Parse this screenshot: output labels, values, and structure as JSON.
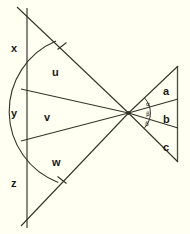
{
  "figure": {
    "background_color": "#fffff2",
    "stroke_color": "#33332b",
    "label_color": "#1a1a14"
  },
  "left_segments": [
    {
      "id": "x",
      "label": "x",
      "x": 11,
      "y": 43
    },
    {
      "id": "y",
      "label": "y",
      "x": 11,
      "y": 108
    },
    {
      "id": "z",
      "label": "z",
      "x": 11,
      "y": 178
    }
  ],
  "left_angles": [
    {
      "id": "u",
      "label": "u",
      "x": 52,
      "y": 67
    },
    {
      "id": "v",
      "label": "v",
      "x": 44,
      "y": 112
    },
    {
      "id": "w",
      "label": "w",
      "x": 52,
      "y": 157
    }
  ],
  "right_sides": [
    {
      "id": "a",
      "label": "a",
      "x": 163,
      "y": 86
    },
    {
      "id": "b",
      "label": "b",
      "x": 163,
      "y": 114
    },
    {
      "id": "c",
      "label": "c",
      "x": 163,
      "y": 142
    }
  ],
  "right_angles": [
    {
      "id": "alpha",
      "label": "α",
      "x": 146,
      "y": 101
    },
    {
      "id": "beta",
      "label": "β",
      "x": 146,
      "y": 111
    },
    {
      "id": "delta",
      "label": "δ",
      "x": 145,
      "y": 121
    }
  ],
  "geometry": {
    "vertex": {
      "x": 128.5,
      "y": 113
    },
    "left_axis": {
      "x": 27,
      "y_top": 8,
      "y_bottom": 228
    },
    "right_axis": {
      "x": 177,
      "y_top": 66,
      "y_bottom": 162
    },
    "rays": [
      {
        "id": "ray-top",
        "to_x": 17,
        "to_y": 7
      },
      {
        "id": "ray-upper-mid",
        "to_x": 21,
        "to_y": 89
      },
      {
        "id": "ray-lower-mid",
        "to_x": 21,
        "to_y": 141
      },
      {
        "id": "ray-bottom",
        "to_x": 21,
        "to_y": 226
      }
    ],
    "right_rays": [
      {
        "id": "right-ray-top",
        "to_x": 178,
        "to_y": 66
      },
      {
        "id": "right-ray-upper-mid",
        "to_x": 178,
        "to_y": 99
      },
      {
        "id": "right-ray-lower-mid",
        "to_x": 178,
        "to_y": 128
      },
      {
        "id": "right-ray-bottom",
        "to_x": 178,
        "to_y": 162
      }
    ],
    "left_arc_radius": 76,
    "right_arc_radius": 22,
    "tick_marks": [
      {
        "id": "tick-upper",
        "x": 62,
        "y": 46
      },
      {
        "id": "tick-lower",
        "x": 62,
        "y": 180
      }
    ]
  }
}
